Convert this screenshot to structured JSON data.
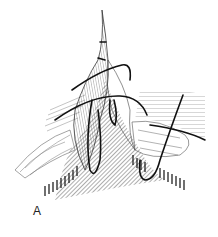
{
  "figure": {
    "panel_label": "A",
    "ink_color": "#111111",
    "background": "#ffffff"
  }
}
